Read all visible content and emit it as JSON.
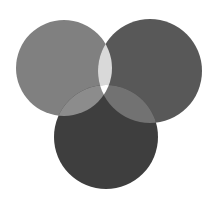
{
  "diagram": {
    "type": "venn",
    "sets": [
      {
        "id": "left",
        "cx": 64,
        "cy": 68,
        "r": 48,
        "color": "#808080"
      },
      {
        "id": "right",
        "cx": 150,
        "cy": 71,
        "r": 52,
        "color": "#585858"
      },
      {
        "id": "bottom",
        "cx": 106,
        "cy": 137,
        "r": 52,
        "color": "#3e3e3e"
      }
    ],
    "intersections": {
      "left_right": "#d9d9d9",
      "left_bottom": "#8c8c8c",
      "right_bottom": "#727272",
      "all_three": "#ffffff"
    },
    "background": "#ffffff"
  }
}
